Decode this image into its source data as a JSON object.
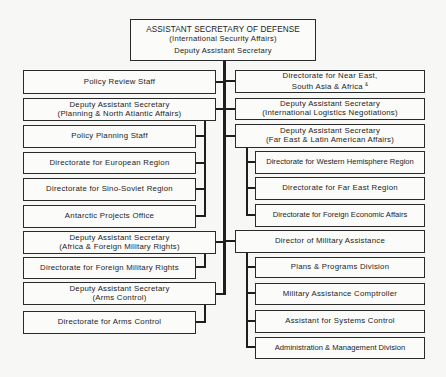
{
  "org_chart": {
    "top": {
      "title": "ASSISTANT SECRETARY OF DEFENSE",
      "subtitle": "(International Security Affairs)",
      "deputy": "Deputy Assistant Secretary"
    },
    "left": {
      "policy_review": "Policy Review Staff",
      "planning_nato": {
        "line1": "Deputy Assistant Secretary",
        "line2": "(Planning & North Atlantic Affairs)",
        "subs": [
          "Policy Planning Staff",
          "Directorate for European Region",
          "Directorate for Sino-Soviet Region",
          "Antarctic Projects Office"
        ]
      },
      "africa_fmr": {
        "line1": "Deputy Assistant Secretary",
        "line2": "(Africa & Foreign Military Rights)",
        "subs": [
          "Directorate for Foreign Military Rights"
        ]
      },
      "arms_control": {
        "line1": "Deputy Assistant Secretary",
        "line2": "(Arms Control)",
        "subs": [
          "Directorate for Arms Control"
        ]
      }
    },
    "right": {
      "near_east": {
        "line1": "Directorate for Near East,",
        "line2": "South Asia & Africa",
        "mark": "&"
      },
      "logistics": {
        "line1": "Deputy Assistant Secretary",
        "line2": "(International Logistics Negotiations)"
      },
      "far_east_latin": {
        "line1": "Deputy Assistant Secretary",
        "line2": "(Far East & Latin American Affairs)",
        "subs": [
          "Directorate for Western Hemisphere Region",
          "Directorate for Far East Region",
          "Directorate for Foreign Economic Affairs"
        ]
      },
      "military_assistance": {
        "label": "Director of Military Assistance",
        "subs": [
          "Plans & Programs Division",
          "Military Assistance Comptroller",
          "Assistant for Systems Control",
          "Administration & Management Division"
        ]
      }
    }
  }
}
